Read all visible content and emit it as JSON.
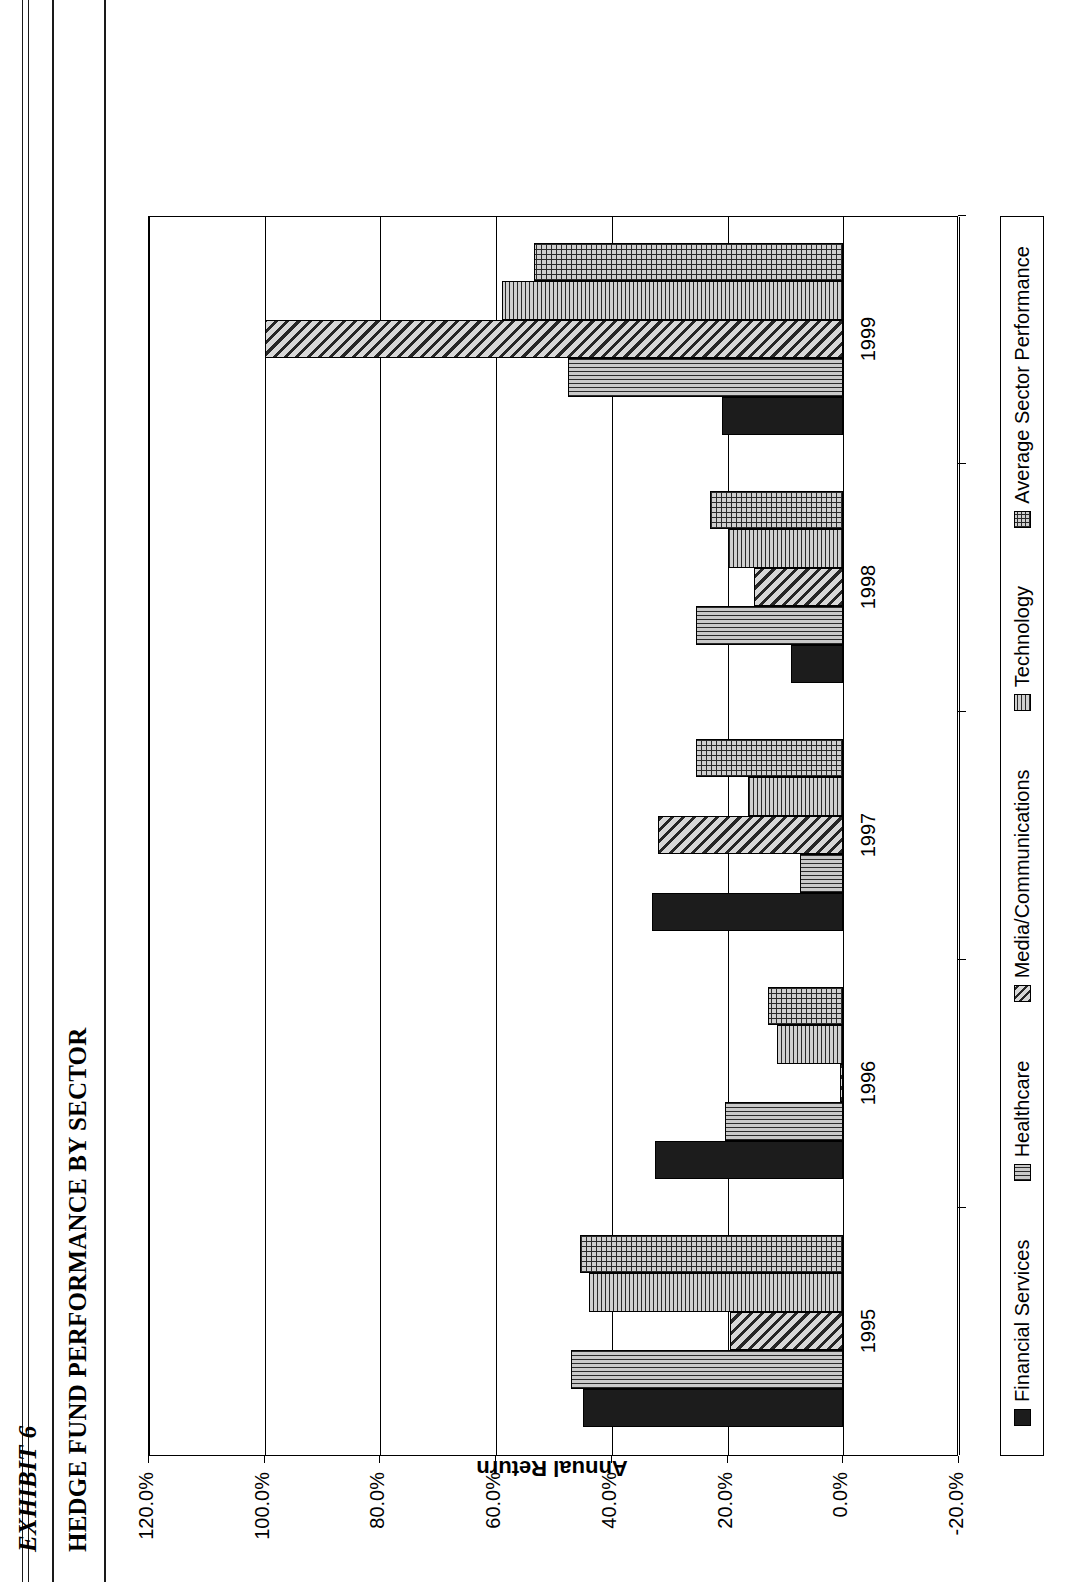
{
  "exhibit": {
    "label": "EXHIBIT 6",
    "title": "HEDGE FUND PERFORMANCE BY SECTOR"
  },
  "chart_data": {
    "type": "bar",
    "orientation": "vertical",
    "title": "HEDGE FUND PERFORMANCE BY SECTOR",
    "xlabel": "",
    "ylabel": "Annual Return",
    "categories": [
      "1995",
      "1996",
      "1997",
      "1998",
      "1999"
    ],
    "ylim": [
      -20.0,
      120.0
    ],
    "ytick_values": [
      -20.0,
      0.0,
      20.0,
      40.0,
      60.0,
      80.0,
      100.0,
      120.0
    ],
    "ytick_labels": [
      "-20.0%",
      "0.0%",
      "20.0%",
      "40.0%",
      "60.0%",
      "80.0%",
      "100.0%",
      "120.0%"
    ],
    "grid": true,
    "legend_position": "bottom",
    "series": [
      {
        "name": "Financial Services",
        "pattern": "solid",
        "values": [
          45.0,
          32.5,
          33.0,
          9.0,
          21.0
        ]
      },
      {
        "name": "Healthcare",
        "pattern": "vert",
        "values": [
          47.0,
          20.5,
          7.5,
          25.5,
          47.5
        ]
      },
      {
        "name": "Media/Communications",
        "pattern": "diag",
        "values": [
          19.5,
          0.5,
          32.0,
          15.5,
          100.0
        ]
      },
      {
        "name": "Technology",
        "pattern": "horiz",
        "values": [
          44.0,
          11.5,
          16.5,
          20.0,
          59.0
        ]
      },
      {
        "name": "Average Sector Performance",
        "pattern": "grid",
        "values": [
          45.5,
          13.0,
          25.5,
          23.0,
          53.5
        ]
      }
    ]
  }
}
